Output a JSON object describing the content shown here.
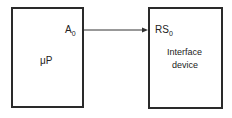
{
  "diagram": {
    "nodes": [
      {
        "id": "microprocessor",
        "label": "μP",
        "pin": {
          "name": "A",
          "subscript": "0"
        }
      },
      {
        "id": "interface-device",
        "label_line1": "Interface",
        "label_line2": "device",
        "pin": {
          "name": "RS",
          "subscript": "0"
        }
      }
    ],
    "edges": [
      {
        "from": "microprocessor.A0",
        "to": "interface-device.RS0",
        "arrow": "end"
      }
    ]
  },
  "mp": {
    "label": "μP",
    "pin_name": "A",
    "pin_sub": "0"
  },
  "dev": {
    "line1": "Interface",
    "line2": "device",
    "pin_name": "RS",
    "pin_sub": "0"
  }
}
